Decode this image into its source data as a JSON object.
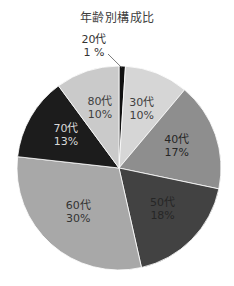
{
  "chart_data": {
    "type": "pie",
    "title": "年齢別構成比",
    "categories": [
      "20代",
      "30代",
      "40代",
      "50代",
      "60代",
      "70代",
      "80代"
    ],
    "values": [
      1,
      10,
      17,
      18,
      30,
      13,
      10
    ],
    "labels": [
      "1 %",
      "10%",
      "17%",
      "18%",
      "30%",
      "13%",
      "10%"
    ],
    "colors": [
      "#111111",
      "#d6d6d6",
      "#8e8e8e",
      "#424242",
      "#a8a8a8",
      "#1c1c1c",
      "#cacaca"
    ],
    "label_colors": [
      "#333333",
      "#404040",
      "#262626",
      "#262626",
      "#333333",
      "#d9d9d9",
      "#404040"
    ],
    "start_angle_deg": 0,
    "direction": "clockwise",
    "legend": "none",
    "data_labels": "category and percent inside slices; 20代 outside with leader line"
  },
  "layout": {
    "cx": 119,
    "cy": 168,
    "r": 102
  }
}
